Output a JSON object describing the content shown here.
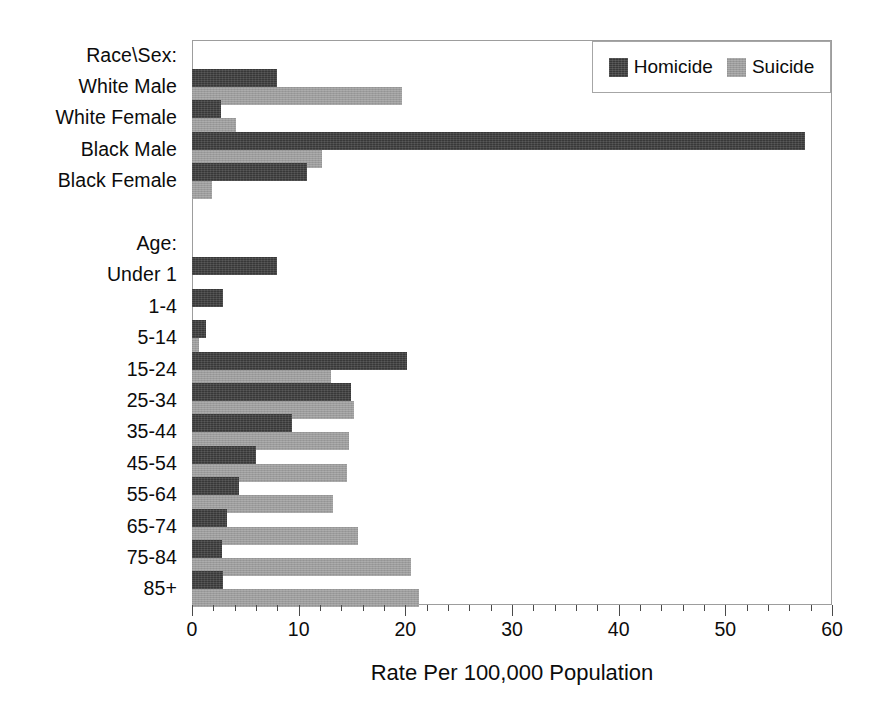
{
  "chart_data": {
    "type": "bar",
    "orientation": "horizontal",
    "title": "",
    "xlabel": "Rate Per 100,000 Population",
    "ylabel": "",
    "xlim": [
      0,
      60
    ],
    "xticks": [
      0,
      10,
      20,
      30,
      40,
      50,
      60
    ],
    "xtick_labels": [
      "0",
      "10",
      "20",
      "30",
      "40",
      "50",
      "60"
    ],
    "minor_tick_step": 2,
    "grid": false,
    "legend_position": "top-right",
    "group_headings": [
      "Race\\Sex:",
      "Age:"
    ],
    "categories": [
      "Race\\Sex:",
      "White Male",
      "White Female",
      "Black Male",
      "Black Female",
      "",
      "Age:",
      "Under 1",
      "1-4",
      "5-14",
      "15-24",
      "25-34",
      "35-44",
      "45-54",
      "55-64",
      "65-74",
      "75-84",
      "85+"
    ],
    "series": [
      {
        "name": "Homicide",
        "color": "#383838",
        "values": [
          null,
          8.0,
          2.7,
          57.5,
          10.8,
          null,
          null,
          8.0,
          2.9,
          1.3,
          20.2,
          14.9,
          9.4,
          6.0,
          4.4,
          3.3,
          2.8,
          2.9
        ]
      },
      {
        "name": "Suicide",
        "color": "#9c9c9c",
        "values": [
          null,
          19.7,
          4.1,
          12.2,
          1.9,
          null,
          null,
          0,
          0,
          0.7,
          13.0,
          15.2,
          14.7,
          14.5,
          13.2,
          15.6,
          20.5,
          21.3
        ]
      }
    ]
  },
  "legend": {
    "entries": [
      {
        "label": "Homicide",
        "swatch": "homicide-swatch"
      },
      {
        "label": "Suicide",
        "swatch": "suicide-swatch"
      }
    ]
  },
  "axis": {
    "title": "Rate Per 100,000 Population",
    "tick_labels": [
      "0",
      "10",
      "20",
      "30",
      "40",
      "50",
      "60"
    ]
  },
  "labels": {
    "race_sex_heading": "Race\\Sex:",
    "white_male": "White Male",
    "white_female": "White Female",
    "black_male": "Black Male",
    "black_female": "Black Female",
    "age_heading": "Age:",
    "under_1": "Under 1",
    "a1_4": "1-4",
    "a5_14": "5-14",
    "a15_24": "15-24",
    "a25_34": "25-34",
    "a35_44": "35-44",
    "a45_54": "45-54",
    "a55_64": "55-64",
    "a65_74": "65-74",
    "a75_84": "75-84",
    "a85_plus": "85+"
  },
  "colors": {
    "homicide": "#383838",
    "suicide": "#9c9c9c",
    "frame": "#9d9d9d",
    "text": "#0c0c0c",
    "background": "#ffffff"
  }
}
